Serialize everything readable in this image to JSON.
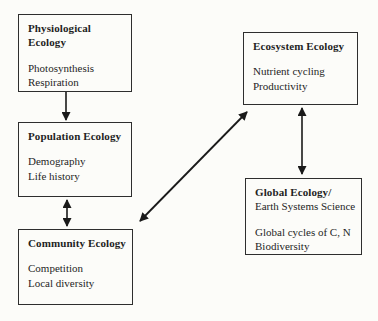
{
  "diagram": {
    "type": "flowchart",
    "colors": {
      "background": "#fcfcf9",
      "box_border": "#2e2e2e",
      "arrow": "#1a1a1a",
      "text": "#1f1f1f"
    },
    "edges": [
      {
        "from": "Physiological Ecology",
        "to": "Population Ecology",
        "direction": "one-way-down"
      },
      {
        "from": "Population Ecology",
        "to": "Community Ecology",
        "direction": "two-way"
      },
      {
        "from": "Community Ecology",
        "to": "Ecosystem Ecology",
        "direction": "two-way"
      },
      {
        "from": "Ecosystem Ecology",
        "to": "Global Ecology/Earth Systems Science",
        "direction": "two-way"
      }
    ]
  },
  "nodes": {
    "physiological": {
      "title": "Physiological Ecology",
      "line1": "Photosynthesis",
      "line2": "Respiration"
    },
    "population": {
      "title": "Population Ecology",
      "line1": "Demography",
      "line2": "Life history"
    },
    "community": {
      "title": "Community Ecology",
      "line1": "Competition",
      "line2": "Local diversity"
    },
    "ecosystem": {
      "title": "Ecosystem Ecology",
      "line1": "Nutrient cycling",
      "line2": "Productivity"
    },
    "global": {
      "title": "Global Ecology/",
      "subtitle": "Earth Systems Science",
      "line1": "Global cycles of C, N",
      "line2": "Biodiversity"
    }
  }
}
